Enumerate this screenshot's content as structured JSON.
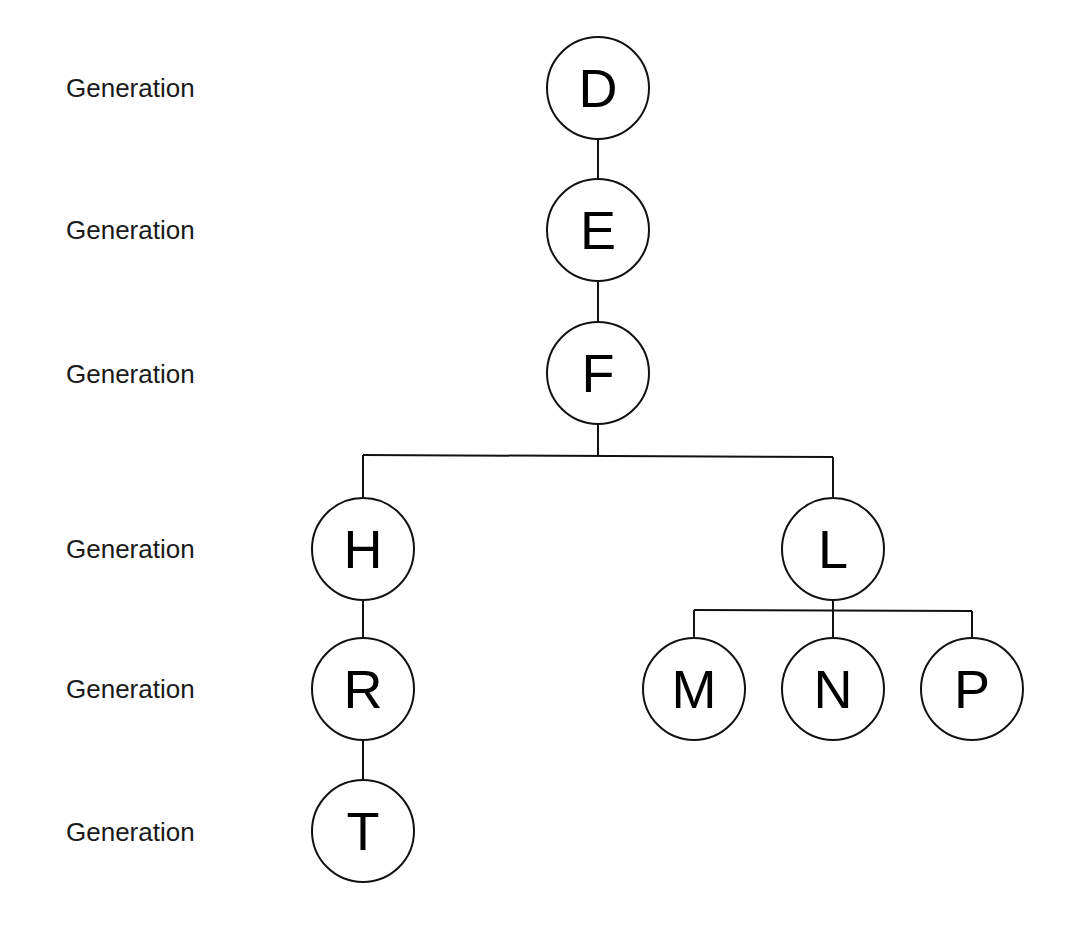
{
  "generation_labels": [
    {
      "text": "Generation",
      "y": 88
    },
    {
      "text": "Generation",
      "y": 230
    },
    {
      "text": "Generation",
      "y": 374
    },
    {
      "text": "Generation",
      "y": 549
    },
    {
      "text": "Generation",
      "y": 689
    },
    {
      "text": "Generation",
      "y": 832
    }
  ],
  "nodes": [
    {
      "id": "D",
      "label": "D",
      "x": 598,
      "y": 88
    },
    {
      "id": "E",
      "label": "E",
      "x": 598,
      "y": 230
    },
    {
      "id": "F",
      "label": "F",
      "x": 598,
      "y": 373
    },
    {
      "id": "H",
      "label": "H",
      "x": 363,
      "y": 549
    },
    {
      "id": "L",
      "label": "L",
      "x": 833,
      "y": 549
    },
    {
      "id": "R",
      "label": "R",
      "x": 363,
      "y": 689
    },
    {
      "id": "T",
      "label": "T",
      "x": 363,
      "y": 831
    },
    {
      "id": "M",
      "label": "M",
      "x": 694,
      "y": 689
    },
    {
      "id": "N",
      "label": "N",
      "x": 833,
      "y": 689
    },
    {
      "id": "P",
      "label": "P",
      "x": 972,
      "y": 689
    }
  ],
  "edges": [
    {
      "from": "D",
      "to": "E"
    },
    {
      "from": "E",
      "to": "F"
    },
    {
      "from": "F",
      "to": "H"
    },
    {
      "from": "F",
      "to": "L"
    },
    {
      "from": "H",
      "to": "R"
    },
    {
      "from": "R",
      "to": "T"
    },
    {
      "from": "L",
      "to": "M"
    },
    {
      "from": "L",
      "to": "N"
    },
    {
      "from": "L",
      "to": "P"
    }
  ],
  "colors": {
    "line": "#111111",
    "node_fill": "#ffffff",
    "text": "#000000",
    "background": "#ffffff"
  }
}
